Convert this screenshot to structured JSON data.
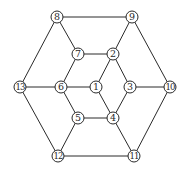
{
  "diagram": {
    "type": "graph",
    "colors": {
      "stroke": "#2a2a2a",
      "fill": "#ffffff",
      "text": "#2a2a2a"
    },
    "node_radius": 6,
    "nodes": [
      {
        "id": "1",
        "label": "1",
        "x": 96,
        "y": 87
      },
      {
        "id": "2",
        "label": "2",
        "x": 113,
        "y": 54
      },
      {
        "id": "3",
        "label": "3",
        "x": 130,
        "y": 87
      },
      {
        "id": "4",
        "label": "4",
        "x": 113,
        "y": 118
      },
      {
        "id": "5",
        "label": "5",
        "x": 78,
        "y": 118
      },
      {
        "id": "6",
        "label": "6",
        "x": 61,
        "y": 87
      },
      {
        "id": "7",
        "label": "7",
        "x": 78,
        "y": 54
      },
      {
        "id": "8",
        "label": "8",
        "x": 57,
        "y": 17
      },
      {
        "id": "9",
        "label": "9",
        "x": 132,
        "y": 17
      },
      {
        "id": "10",
        "label": "10",
        "x": 170,
        "y": 87
      },
      {
        "id": "11",
        "label": "11",
        "x": 134,
        "y": 156
      },
      {
        "id": "12",
        "label": "12",
        "x": 58,
        "y": 156
      },
      {
        "id": "13",
        "label": "13",
        "x": 20,
        "y": 87
      }
    ],
    "edges": [
      [
        "8",
        "9"
      ],
      [
        "9",
        "10"
      ],
      [
        "10",
        "11"
      ],
      [
        "11",
        "12"
      ],
      [
        "12",
        "13"
      ],
      [
        "13",
        "8"
      ],
      [
        "8",
        "7"
      ],
      [
        "9",
        "2"
      ],
      [
        "10",
        "3"
      ],
      [
        "11",
        "4"
      ],
      [
        "12",
        "5"
      ],
      [
        "13",
        "6"
      ],
      [
        "7",
        "2"
      ],
      [
        "2",
        "3"
      ],
      [
        "3",
        "4"
      ],
      [
        "4",
        "5"
      ],
      [
        "5",
        "6"
      ],
      [
        "6",
        "7"
      ],
      [
        "1",
        "2"
      ],
      [
        "1",
        "4"
      ],
      [
        "1",
        "6"
      ]
    ]
  }
}
